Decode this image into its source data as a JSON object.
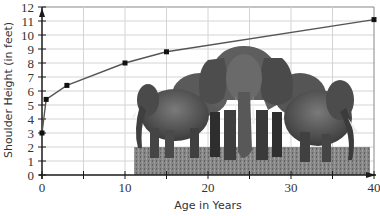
{
  "chart_data": {
    "type": "line",
    "title": "",
    "xlabel": "Age in Years",
    "ylabel": "Shoulder Height (in feet)",
    "xlim": [
      0,
      40
    ],
    "ylim": [
      0,
      12
    ],
    "x_ticks": [
      0,
      10,
      20,
      30,
      40
    ],
    "x_minor_ticks": [
      5,
      15,
      25,
      35
    ],
    "y_ticks": [
      0,
      1,
      2,
      3,
      4,
      5,
      6,
      7,
      8,
      9,
      10,
      11,
      12
    ],
    "grid": true,
    "legend": null,
    "series": [
      {
        "name": "Elephant shoulder height",
        "x": [
          0,
          0.5,
          3,
          10,
          15,
          40
        ],
        "y": [
          3,
          5.4,
          6.4,
          8,
          8.8,
          11.1
        ],
        "color": "#555555",
        "marker": "square"
      }
    ],
    "annotations": [
      {
        "type": "image",
        "description": "grayscale photo of a group of elephants"
      }
    ]
  },
  "colors": {
    "grid": "#d4d4d4",
    "axis": "#1a1a1a",
    "line": "#555555",
    "marker": "#111111",
    "top_border": "#888888"
  },
  "photo": {
    "description": "herd of elephants"
  }
}
